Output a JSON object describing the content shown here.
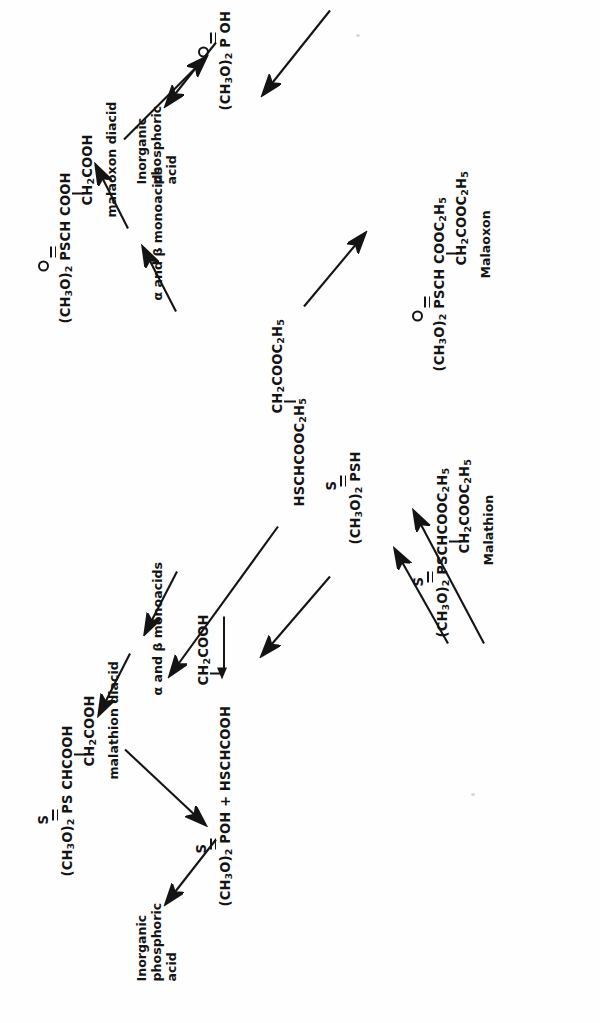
{
  "diagram": {
    "orientation": "rotated-90-ccw",
    "ink_color": "#141414",
    "background_color": "#fefefe"
  },
  "nodes": {
    "malathion": {
      "line1": "(CH3O)2 PSCHCOOC2H5",
      "line2": "CH2COOC2H5",
      "name": "Malathion",
      "hetero": "S",
      "bond": "double"
    },
    "malaoxon": {
      "line1": "(CH3O)2 PSCH COOC2H5",
      "line2": "CH2COOC2H5",
      "name": "Malaoxon",
      "hetero": "O",
      "bond": "double"
    },
    "malathion_diacid": {
      "line1": "(CH3O)2 PS CHCOOH",
      "line2": "CH2COOH",
      "name": "malathion diacid",
      "hetero": "S",
      "bond": "double"
    },
    "malaoxon_diacid": {
      "line1": "(CH3O)2 PSCH COOH",
      "line2": "CH2COOH",
      "name": "malaoxon diacid",
      "hetero": "O",
      "bond": "double"
    },
    "dimethyl_phosphorothioic_acid": {
      "line1": "(CH3O)2 POH + HSCHCOOH",
      "line2": "CH2COOH",
      "hetero": "S",
      "bond": "double"
    },
    "dimethyl_phosphoric_acid": {
      "line1": "(CH3O)2 P OH",
      "hetero": "O",
      "bond": "double"
    },
    "dimethyl_phosphorodithioic_acid": {
      "line1": "(CH3O)2 PSH",
      "hetero": "S",
      "bond": "double"
    },
    "dimethyl_phosphorothioate_sh": {
      "line1": "(CH3O)2 PSH",
      "hetero": "O",
      "bond": "double"
    },
    "mercapto_diester": {
      "line1": "HSCHCOOC2H5",
      "line2": "CH2COOC2H5"
    }
  },
  "labels": {
    "monoacids_top": "α and β monoacids",
    "monoacids_bottom": "α and β monoacids",
    "inorganic_phosphoric_acid_top": "Inorganic\nphosphoric\nacid",
    "inorganic_phosphoric_acid_bottom": "Inorganic\nphosphoric\nacid",
    "inorganic_top_l1": "Inorganic",
    "inorganic_top_l2": "phosphoric",
    "inorganic_top_l3": "acid",
    "inorganic_bot_l1": "Inorganic",
    "inorganic_bot_l2": "phosphoric",
    "inorganic_bot_l3": "acid"
  },
  "chart_data": {
    "type": "diagram",
    "graph_nodes": [
      {
        "id": "malathion",
        "label": "Malathion",
        "formula": "(CH3O)2 P(=S) SCHCOOC2H5 / CH2COOC2H5"
      },
      {
        "id": "malaoxon",
        "label": "Malaoxon",
        "formula": "(CH3O)2 P(=O) SCH COOC2H5 / CH2COOC2H5"
      },
      {
        "id": "malathion_diacid",
        "label": "malathion diacid",
        "formula": "(CH3O)2 P(=S) S CHCOOH / CH2COOH"
      },
      {
        "id": "malaoxon_diacid",
        "label": "malaoxon diacid",
        "formula": "(CH3O)2 P(=O) SCH COOH / CH2COOH"
      },
      {
        "id": "monoacids_top",
        "label": "α and β monoacids"
      },
      {
        "id": "monoacids_bottom",
        "label": "α and β monoacids"
      },
      {
        "id": "phosphorothioic",
        "label": "(CH3O)2 P(=S) OH + HSCHCOOH / CH2COOH"
      },
      {
        "id": "phosphoric",
        "label": "(CH3O)2 P(=O) OH"
      },
      {
        "id": "dithioic",
        "label": "(CH3O)2 P(=S) SH"
      },
      {
        "id": "thioate_sh",
        "label": "(CH3O)2 P(=O) SH"
      },
      {
        "id": "mercapto_diester",
        "label": "HSCHCOOC2H5 / CH2COOC2H5"
      },
      {
        "id": "inorganic_top",
        "label": "Inorganic phosphoric acid"
      },
      {
        "id": "inorganic_bottom",
        "label": "Inorganic phosphoric acid"
      }
    ],
    "edges": [
      {
        "from": "malathion",
        "to": "malaoxon",
        "style": "straight"
      },
      {
        "from": "malathion",
        "to": "monoacids_top"
      },
      {
        "from": "monoacids_top",
        "to": "malathion_diacid"
      },
      {
        "from": "malathion_diacid",
        "to": "phosphorothioic"
      },
      {
        "from": "phosphorothioic",
        "to": "inorganic_top"
      },
      {
        "from": "malathion",
        "to": "dithioic"
      },
      {
        "from": "malathion",
        "to": "mercapto_diester"
      },
      {
        "from": "dithioic",
        "to": "phosphorothioic"
      },
      {
        "from": "mercapto_diester",
        "to": "phosphorothioic_ch2cooh"
      },
      {
        "from": "malaoxon",
        "to": "monoacids_bottom"
      },
      {
        "from": "monoacids_bottom",
        "to": "malaoxon_diacid"
      },
      {
        "from": "malaoxon_diacid",
        "to": "phosphoric"
      },
      {
        "from": "malaoxon",
        "to": "thioate_sh"
      },
      {
        "from": "thioate_sh",
        "to": "phosphoric"
      },
      {
        "from": "phosphoric",
        "to": "inorganic_bottom"
      }
    ]
  }
}
